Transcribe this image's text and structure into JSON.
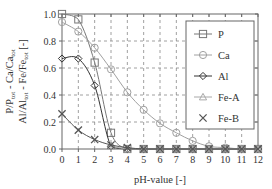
{
  "chart_data": {
    "type": "line",
    "title": "",
    "xlabel": "pH-value [-]",
    "ylabel_lines": [
      {
        "parts": [
          [
            "P/P",
            ""
          ],
          [
            "tot",
            "sub"
          ],
          [
            " - Ca/Ca",
            ""
          ],
          [
            "tot",
            "sub"
          ]
        ]
      },
      {
        "parts": [
          [
            "Al/Al",
            ""
          ],
          [
            "tot",
            "sub"
          ],
          [
            " - Fe/Fe",
            ""
          ],
          [
            "tot",
            "sub"
          ],
          [
            " [-]",
            ""
          ]
        ]
      }
    ],
    "xlim": [
      0,
      12
    ],
    "ylim": [
      0,
      1.0
    ],
    "xticks": [
      0,
      1,
      2,
      3,
      4,
      5,
      6,
      7,
      8,
      9,
      10,
      11,
      12
    ],
    "yticks": [
      0.0,
      0.2,
      0.4,
      0.6,
      0.8,
      1.0
    ],
    "ytick_labels": [
      "0.0",
      "0.2",
      "0.4",
      "0.6",
      "0.8",
      "1.0"
    ],
    "grid": true,
    "legend_position": "top-right",
    "x": [
      0,
      1,
      2,
      3,
      4,
      5,
      6,
      7,
      8,
      9,
      10,
      11,
      12
    ],
    "series": [
      {
        "name": "P",
        "marker": "square",
        "color": "#777777",
        "values": [
          1.0,
          0.96,
          0.64,
          0.12,
          0.0,
          0.0,
          0.0,
          0.0,
          0.0,
          0.0,
          0.0,
          0.0,
          0.0
        ]
      },
      {
        "name": "Ca",
        "marker": "circle",
        "color": "#a0a0a0",
        "values": [
          0.94,
          0.87,
          0.75,
          0.59,
          0.42,
          0.29,
          0.19,
          0.12,
          0.06,
          0.02,
          0.01,
          0.0,
          0.0
        ]
      },
      {
        "name": "Al",
        "marker": "diamond",
        "color": "#333333",
        "values": [
          0.67,
          0.67,
          0.47,
          0.02,
          0.0,
          0.0,
          0.0,
          0.0,
          0.0,
          0.0,
          0.0,
          0.0,
          0.0
        ]
      },
      {
        "name": "Fe-A",
        "marker": "triangle",
        "color": "#a8a8a8",
        "values": [
          null,
          null,
          null,
          0.02,
          0.0,
          0.0,
          0.0,
          0.0,
          0.0,
          0.0,
          0.0,
          0.0,
          0.0
        ]
      },
      {
        "name": "Fe-B",
        "marker": "x",
        "color": "#555555",
        "values": [
          0.26,
          0.14,
          0.07,
          0.03,
          0.01,
          0.0,
          0.0,
          0.0,
          0.0,
          0.0,
          0.0,
          0.0,
          0.0
        ]
      }
    ]
  }
}
